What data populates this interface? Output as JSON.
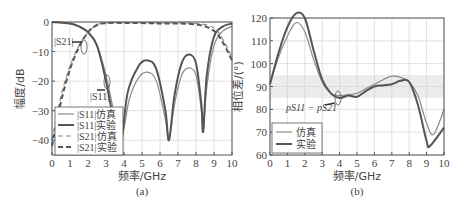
{
  "chart_data": [
    {
      "type": "line",
      "panel": "(a)",
      "xlabel": "频率/GHz",
      "ylabel": "幅度/dB",
      "xlim": [
        0,
        10
      ],
      "ylim": [
        -45,
        0
      ],
      "xticks": [
        "0",
        "1",
        "2",
        "3",
        "4",
        "5",
        "6",
        "7",
        "8",
        "9",
        "10"
      ],
      "yticks": [
        "0",
        "-10",
        "-20",
        "-30",
        "-40"
      ],
      "grid": true,
      "legend_position": "lower-left",
      "annotations": [
        "|S21|",
        "|S11|"
      ],
      "series": [
        {
          "name": "|S11|仿真",
          "style": "solid-thin",
          "x": [
            0,
            1,
            1.5,
            2,
            2.5,
            3,
            3.5,
            3.9,
            4.3,
            4.8,
            5.3,
            5.8,
            6.3,
            6.5,
            6.8,
            7.2,
            7.6,
            8,
            8.3,
            8.4,
            8.6,
            9,
            9.5,
            10
          ],
          "y": [
            0,
            -0.5,
            -1.5,
            -3.5,
            -8,
            -18,
            -32,
            -38,
            -26,
            -19,
            -17,
            -20,
            -33,
            -40,
            -28,
            -18,
            -15.5,
            -18,
            -30,
            -37,
            -22,
            -8,
            -3,
            -1.5
          ]
        },
        {
          "name": "|S11|实验",
          "style": "solid-thick",
          "x": [
            0,
            1,
            1.5,
            2,
            2.5,
            3,
            3.5,
            3.8,
            4.2,
            4.8,
            5.3,
            5.8,
            6.3,
            6.5,
            6.8,
            7.2,
            7.6,
            8,
            8.3,
            8.4,
            8.6,
            9,
            9.5,
            10
          ],
          "y": [
            0,
            -0.5,
            -1.5,
            -3.5,
            -8,
            -20,
            -36,
            -43,
            -24,
            -15,
            -13,
            -16,
            -30,
            -40,
            -25,
            -14,
            -11,
            -14,
            -28,
            -37,
            -18,
            -5,
            -1.5,
            -0.5
          ]
        },
        {
          "name": "|S21|仿真",
          "style": "dashed-thin",
          "x": [
            0,
            0.5,
            1,
            1.5,
            2,
            2.5,
            3,
            4,
            6,
            8,
            9,
            9.5,
            10
          ],
          "y": [
            -40,
            -25,
            -15,
            -8,
            -3.5,
            -1,
            -0.3,
            -0.2,
            -0.3,
            -0.5,
            -2,
            -6,
            -12
          ]
        },
        {
          "name": "|S21|实验",
          "style": "dashed-thick",
          "x": [
            0,
            0.5,
            1,
            1.5,
            2,
            2.5,
            3,
            4,
            6,
            8,
            9,
            9.5,
            10
          ],
          "y": [
            -42,
            -27,
            -16,
            -8.5,
            -3.5,
            -1,
            -0.4,
            -0.3,
            -0.5,
            -0.8,
            -3,
            -7,
            -13
          ]
        }
      ]
    },
    {
      "type": "line",
      "panel": "(b)",
      "xlabel": "频率/GHz",
      "ylabel": "相位差/(°)",
      "xlim": [
        0,
        10
      ],
      "ylim": [
        60,
        120
      ],
      "xticks": [
        "0",
        "1",
        "2",
        "3",
        "4",
        "5",
        "6",
        "7",
        "8",
        "9",
        "10"
      ],
      "yticks": [
        "120",
        "110",
        "100",
        "90",
        "80",
        "70",
        "60"
      ],
      "grid": true,
      "highlight_band": [
        85,
        95
      ],
      "legend_position": "lower-left",
      "annotations": [
        "pS11 - pS21"
      ],
      "series": [
        {
          "name": "仿真",
          "style": "solid-thin",
          "x": [
            0,
            0.5,
            1,
            1.5,
            2,
            2.5,
            3,
            3.5,
            4,
            4.5,
            5,
            5.5,
            6,
            6.5,
            7,
            7.5,
            8,
            8.5,
            9,
            9.4,
            10
          ],
          "y": [
            91,
            103,
            112,
            118,
            114,
            102,
            92,
            87,
            86,
            86.5,
            87,
            89,
            91,
            93,
            94.5,
            94,
            92,
            86,
            74,
            69,
            80
          ]
        },
        {
          "name": "实验",
          "style": "solid-thick",
          "x": [
            0,
            0.5,
            1,
            1.5,
            2,
            2.5,
            3,
            3.5,
            4,
            4.5,
            5,
            5.5,
            6,
            6.5,
            7,
            7.5,
            8,
            8.5,
            9,
            9.2,
            10
          ],
          "y": [
            91,
            105,
            116,
            122,
            120,
            106,
            93,
            87,
            85,
            86,
            85.5,
            88,
            90,
            90.5,
            91,
            92.5,
            92,
            82,
            66,
            64,
            72
          ]
        }
      ]
    }
  ],
  "panel_a": {
    "ylabel": "幅度/dB",
    "xlabel": "频率/GHz",
    "caption": "(a)",
    "ann_s21": "|S21|",
    "ann_s11": "|S11|",
    "legend": [
      "|S11|仿真",
      "|S11|实验",
      "|S21|仿真",
      "|S21|实验"
    ]
  },
  "panel_b": {
    "ylabel": "相位差/(°)",
    "xlabel": "频率/GHz",
    "caption": "(b)",
    "ann": "pS11 − pS21",
    "legend": [
      "仿真",
      "实验"
    ]
  }
}
